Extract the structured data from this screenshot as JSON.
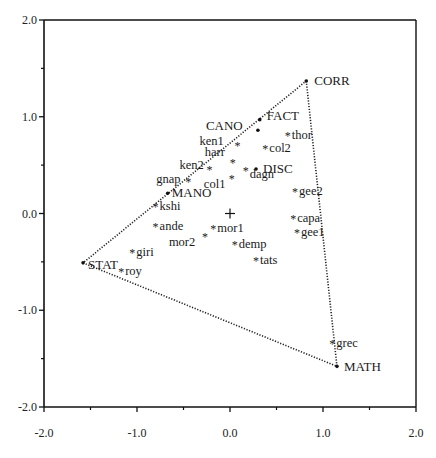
{
  "chart_data": {
    "type": "scatter",
    "title": "",
    "xlabel": "",
    "ylabel": "",
    "xlim": [
      -2.0,
      2.0
    ],
    "ylim": [
      -2.0,
      2.0
    ],
    "grid": false,
    "legend": null,
    "x_ticks": [
      "-2.0",
      "-1.0",
      "0.0",
      "1.0",
      "2.0"
    ],
    "y_ticks": [
      "2.0",
      "1.0",
      "0.0",
      "-1.0",
      "-2.0"
    ],
    "origin_marker": {
      "x": 0.0,
      "y": 0.0,
      "symbol": "+"
    },
    "polygon": {
      "style": "dotted",
      "vertices": [
        "CORR",
        "MATH",
        "STAT"
      ]
    },
    "series": [
      {
        "name": "methods",
        "marker": "dot",
        "points": [
          {
            "label": "CORR",
            "x": 0.82,
            "y": 1.37
          },
          {
            "label": "FACT",
            "x": 0.32,
            "y": 0.97
          },
          {
            "label": "CANO",
            "x": 0.3,
            "y": 0.86
          },
          {
            "label": "DISC",
            "x": 0.28,
            "y": 0.46
          },
          {
            "label": "MANO",
            "x": -0.67,
            "y": 0.21
          },
          {
            "label": "STAT",
            "x": -1.58,
            "y": -0.51
          },
          {
            "label": "MATH",
            "x": 1.15,
            "y": -1.58
          }
        ]
      },
      {
        "name": "authors",
        "marker": "asterisk",
        "points": [
          {
            "label": "thor",
            "x": 0.62,
            "y": 0.81
          },
          {
            "label": "col2",
            "x": 0.38,
            "y": 0.68
          },
          {
            "label": "ken1",
            "x": 0.08,
            "y": 0.71
          },
          {
            "label": "harr",
            "x": 0.03,
            "y": 0.53
          },
          {
            "label": "dagn",
            "x": 0.17,
            "y": 0.45
          },
          {
            "label": "col1",
            "x": 0.02,
            "y": 0.37
          },
          {
            "label": "ken2",
            "x": -0.22,
            "y": 0.46
          },
          {
            "label": "gnap",
            "x": -0.45,
            "y": 0.34
          },
          {
            "label": "kshi",
            "x": -0.8,
            "y": 0.08
          },
          {
            "label": "ande",
            "x": -0.8,
            "y": -0.13
          },
          {
            "label": "mor1",
            "x": -0.18,
            "y": -0.15
          },
          {
            "label": "mor2",
            "x": -0.27,
            "y": -0.23
          },
          {
            "label": "demp",
            "x": 0.05,
            "y": -0.32
          },
          {
            "label": "tats",
            "x": 0.28,
            "y": -0.48
          },
          {
            "label": "giri",
            "x": -1.05,
            "y": -0.4
          },
          {
            "label": "roy",
            "x": -1.17,
            "y": -0.59
          },
          {
            "label": "gee2",
            "x": 0.7,
            "y": 0.23
          },
          {
            "label": "capa",
            "x": 0.68,
            "y": -0.05
          },
          {
            "label": "gee1",
            "x": 0.72,
            "y": -0.19
          },
          {
            "label": "grec",
            "x": 1.1,
            "y": -1.34
          }
        ]
      }
    ]
  }
}
